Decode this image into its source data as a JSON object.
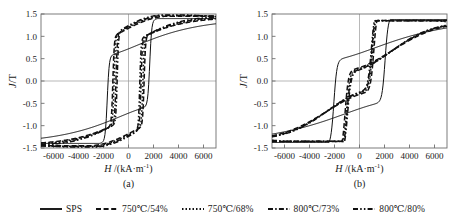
{
  "figure": {
    "caption_a": "(a)",
    "caption_b": "(b)",
    "xlabel_html": "H /(kA·m⁻¹)",
    "ylabel_html": "J/T"
  },
  "legend": {
    "items": [
      {
        "label": "SPS",
        "style": "solid",
        "color": "#111111"
      },
      {
        "label": "750℃/54%",
        "style": "dashed",
        "color": "#111111"
      },
      {
        "label": "750℃/68%",
        "style": "dotted",
        "color": "#111111"
      },
      {
        "label": "800℃/73%",
        "style": "dashdot",
        "color": "#111111"
      },
      {
        "label": "800℃/80%",
        "style": "dashdotdot",
        "color": "#111111"
      }
    ]
  },
  "chart_data": {
    "type": "line",
    "title": "",
    "xlabel": "H /(kA·m⁻¹)",
    "ylabel": "J/T",
    "xlim": [
      -7000,
      7000
    ],
    "ylim": [
      -1.5,
      1.5
    ],
    "xticks": [
      -6000,
      -4000,
      -2000,
      0,
      2000,
      4000,
      6000
    ],
    "xticklabels": [
      "-6000",
      "-4000",
      "-2000",
      "0",
      "2000",
      "4000",
      "6000"
    ],
    "yticks": [
      -1.5,
      -1.0,
      -0.5,
      0.0,
      0.5,
      1.0,
      1.5
    ],
    "yticklabels": [
      "-1.5",
      "-1.0",
      "-0.5",
      "0.0",
      "0.5",
      "1.0",
      "1.5"
    ],
    "grid": "zero-lines-only",
    "legend_position": "below",
    "panels": [
      {
        "id": "a",
        "caption": "(a)",
        "series": [
          {
            "name": "SPS",
            "style": "solid",
            "Hc": 1700,
            "Jr": 0.72,
            "Js": 1.37,
            "squareness": 0.55
          },
          {
            "name": "750℃/54%",
            "style": "dashed",
            "Hc": 1250,
            "Jr": 1.18,
            "Js": 1.42,
            "squareness": 0.86
          },
          {
            "name": "750℃/68%",
            "style": "dotted",
            "Hc": 1150,
            "Jr": 1.2,
            "Js": 1.43,
            "squareness": 0.88
          },
          {
            "name": "800℃/73%",
            "style": "dashdot",
            "Hc": 1000,
            "Jr": 1.22,
            "Js": 1.44,
            "squareness": 0.9
          },
          {
            "name": "800℃/80%",
            "style": "dashdotdot",
            "Hc": 900,
            "Jr": 1.24,
            "Js": 1.45,
            "squareness": 0.91
          }
        ]
      },
      {
        "id": "b",
        "caption": "(b)",
        "series": [
          {
            "name": "SPS",
            "style": "solid",
            "Hc": 2050,
            "Jr": 0.62,
            "Js": 1.35,
            "squareness": 0.3
          },
          {
            "name": "750℃/54%",
            "style": "dashed",
            "Hc": 1150,
            "Jr": 0.3,
            "Js": 1.33,
            "squareness": 0.26
          },
          {
            "name": "750℃/68%",
            "style": "dotted",
            "Hc": 1050,
            "Jr": 0.28,
            "Js": 1.33,
            "squareness": 0.25
          },
          {
            "name": "800℃/73%",
            "style": "dashdot",
            "Hc": 1000,
            "Jr": 0.26,
            "Js": 1.32,
            "squareness": 0.24
          },
          {
            "name": "800℃/80%",
            "style": "dashdotdot",
            "Hc": 950,
            "Jr": 0.25,
            "Js": 1.32,
            "squareness": 0.23
          }
        ]
      }
    ]
  }
}
